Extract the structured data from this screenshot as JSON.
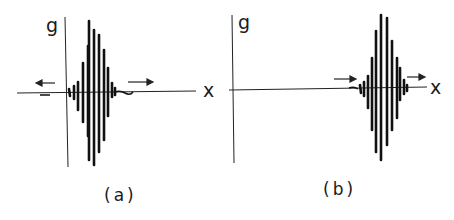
{
  "figure": {
    "panels": [
      {
        "id": "a",
        "caption": "(a)",
        "y_axis_label": "g",
        "x_axis_label": "x",
        "description": "Wave packet centered near origin, spreading in both directions",
        "arrows": [
          "left",
          "right"
        ]
      },
      {
        "id": "b",
        "caption": "(b)",
        "y_axis_label": "g",
        "x_axis_label": "x",
        "description": "Wave packet translated to the right along x",
        "arrows": [
          "right",
          "right"
        ]
      }
    ],
    "colors": {
      "ink": "#1a1a1a",
      "background": "#ffffff"
    }
  }
}
